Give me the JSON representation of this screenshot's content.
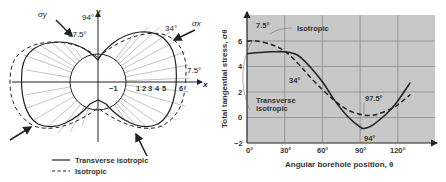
{
  "figure": {
    "polar": {
      "axis_x_label": "x",
      "axis_y_label": "y",
      "sigma_x_label": "σx",
      "sigma_y_label": "σy",
      "angle_labels": [
        "94°",
        "97.5°",
        "34°",
        "7.5°"
      ],
      "scale_labels": [
        "−1",
        "1",
        "2",
        "3",
        "4",
        "5",
        "6"
      ],
      "scale_unit": "6σ",
      "legend": [
        {
          "label": "Transverse isotropic",
          "style": "solid"
        },
        {
          "label": "Isotropic",
          "style": "dashed"
        }
      ]
    },
    "chart": {
      "ylabel": "Total tangential stress, σθ",
      "xlabel": "Angular borehole position, θ",
      "annotations": {
        "a1": "7.5°",
        "a2": "Isotropic",
        "a3": "34°",
        "a4": "Transverse",
        "a5": "isotropic",
        "a6": "97.5°",
        "a7": "94°"
      },
      "xticks": [
        "0°",
        "30°",
        "60°",
        "90°",
        "120°"
      ],
      "yticks": [
        "6",
        "4",
        "2",
        "0",
        "−2"
      ],
      "background": "#c8c8c8"
    }
  },
  "chart_data": {
    "type": "line",
    "title": "",
    "xlabel": "Angular borehole position, θ",
    "ylabel": "Total tangential stress, σθ",
    "xlim": [
      0,
      140
    ],
    "ylim": [
      -2,
      7.5
    ],
    "xticks": [
      0,
      30,
      60,
      90,
      120
    ],
    "yticks": [
      -2,
      0,
      2,
      4,
      6
    ],
    "grid": true,
    "legend_position": "inline annotations",
    "series": [
      {
        "name": "Transverse isotropic",
        "style": "solid",
        "x": [
          0,
          10,
          20,
          30,
          40,
          50,
          60,
          70,
          80,
          90,
          94,
          100,
          110,
          115,
          120,
          130
        ],
        "y": [
          5.0,
          5.1,
          5.15,
          5.15,
          4.9,
          4.0,
          2.8,
          1.3,
          0.1,
          -0.75,
          -0.85,
          -0.6,
          0.2,
          0.7,
          1.3,
          2.75
        ]
      },
      {
        "name": "Isotropic",
        "style": "dashed",
        "x": [
          0,
          7.5,
          20,
          30,
          40,
          50,
          60,
          70,
          80,
          90,
          97.5,
          105,
          115,
          120,
          130
        ],
        "y": [
          6.0,
          6.0,
          5.7,
          5.2,
          4.3,
          3.2,
          2.2,
          1.3,
          0.6,
          0.25,
          0.15,
          0.3,
          0.7,
          1.0,
          1.8
        ]
      }
    ],
    "annotations": [
      {
        "text": "7.5°",
        "x": 7.5,
        "y": 6.0
      },
      {
        "text": "34°",
        "x": 34,
        "y": 5.1
      },
      {
        "text": "94°",
        "x": 94,
        "y": -0.85
      },
      {
        "text": "97.5°",
        "x": 97.5,
        "y": 0.15
      }
    ]
  }
}
